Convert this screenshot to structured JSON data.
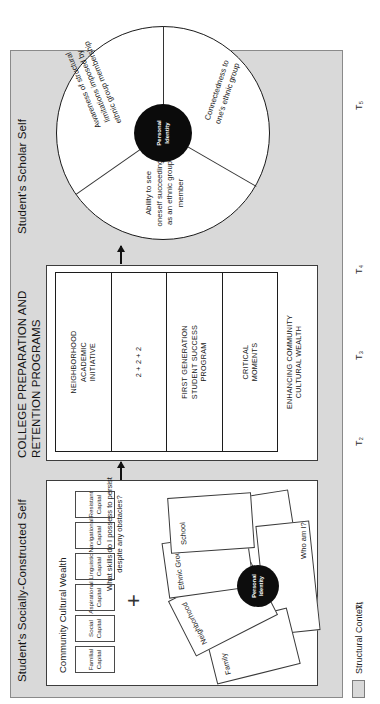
{
  "figure": {
    "panels": {
      "left_title": "Student's Socially-Constructed Self",
      "middle_title": "COLLEGE PREPARATION AND\nRETENTION PROGRAMS",
      "right_title": "Student's Scholar Self"
    },
    "left_panel": {
      "community_cultural_wealth_label": "Community Cultural Wealth",
      "capitals": [
        {
          "label": "Familial\nCapital"
        },
        {
          "label": "Social\nCapital"
        },
        {
          "label": "Aspirational\nCapital"
        },
        {
          "label": "Linguistic\nCapital"
        },
        {
          "label": "Navigational\nCapital"
        },
        {
          "label": "Resistant\nCapital"
        }
      ],
      "plus": "+",
      "cards": [
        {
          "label": "Family"
        },
        {
          "label": "Neighborhood"
        },
        {
          "label": "Ethnic Group"
        },
        {
          "label": "School"
        }
      ],
      "center_label": "Personal\nIdentity",
      "question_identity": "Who am I?",
      "question_skills": "What skills do I possess to persist\ndespite any obstacles?"
    },
    "middle_panel": {
      "programs": [
        {
          "label": "NEIGHBORHOOD\nACADEMIC\nINITIATIVE"
        },
        {
          "label": "2 + 2 + 2"
        },
        {
          "label": "FIRST GENERATION\nSTUDENT SUCCESS\nPROGRAM"
        },
        {
          "label": "CRITICAL\nMOMENTS"
        }
      ],
      "footer_label": "ENHANCING COMMUNITY\nCULTURAL WEALTH"
    },
    "right_panel": {
      "center_label": "Personal\nIdentity",
      "slices": [
        {
          "label": "Ability to see\noneself succeeding\nas an ethnic group\nmember"
        },
        {
          "label": "Awareness of structural\nlimitations imposed by\nethnic group membership"
        },
        {
          "label": "Connectedness to\none's ethnic group"
        }
      ]
    },
    "timeline": {
      "marks": [
        "T₁",
        "T₂",
        "T₃",
        "T₄",
        "T₅"
      ]
    },
    "legend": {
      "label": "Structural Context",
      "swatch_color": "#d9d9d9"
    }
  }
}
